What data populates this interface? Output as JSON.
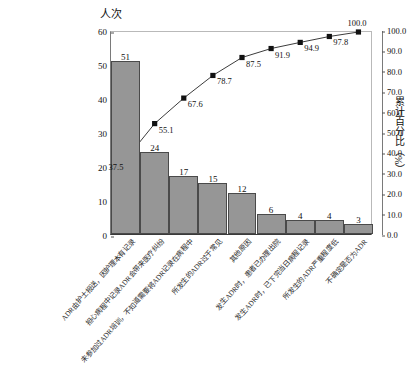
{
  "chart_data": {
    "type": "bar",
    "title": "",
    "subtitle": "",
    "ylabel": "人次",
    "ylabel_secondary": "累计百分比（%）",
    "xlabel": "",
    "grid": false,
    "legend": "none",
    "ylim": [
      0,
      60
    ],
    "ylim_secondary": [
      0,
      100
    ],
    "yticks": [
      "60",
      "50",
      "40",
      "30",
      "20",
      "10",
      "0"
    ],
    "yticks_secondary": [
      "100.0",
      "90.0",
      "80.0",
      "70.0",
      "60.0",
      "50.0",
      "40.0",
      "30.0",
      "20.0",
      "10.0",
      "0.0"
    ],
    "categories": [
      "ADR由护士报送，因护理本有记录",
      "担心病程中记录ADR会带来医疗纠纷",
      "未参加过ADR培训，不知道需要将ADR记录在病程中",
      "所发生的ADR过于常见",
      "其他原因",
      "发生ADR时，患者已办理出院",
      "发生ADR时，已下完当日病程记录",
      "所发生的ADR严重程度低",
      "不确定是否为ADR"
    ],
    "values": [
      51,
      24,
      17,
      15,
      12,
      6,
      4,
      4,
      3
    ],
    "series": [
      {
        "name": "频数",
        "type": "bar",
        "values": [
          51,
          24,
          17,
          15,
          12,
          6,
          4,
          4,
          3
        ]
      },
      {
        "name": "累计百分比",
        "type": "line",
        "axis": "secondary",
        "values": [
          37.5,
          55.1,
          67.6,
          78.7,
          87.5,
          91.9,
          94.9,
          97.8,
          100.0
        ]
      }
    ],
    "bar_labels": [
      "51",
      "24",
      "17",
      "15",
      "12",
      "6",
      "4",
      "4",
      "3"
    ],
    "point_labels": [
      "37.5",
      "55.1",
      "67.6",
      "78.7",
      "87.5",
      "91.9",
      "94.9",
      "97.8",
      "100.0"
    ],
    "colors": {
      "bar_fill": "#969696",
      "bar_stroke": "#4a4a4a",
      "line": "#3c3c3c",
      "marker": "#111111",
      "axis": "#555555",
      "background": "#ffffff"
    }
  }
}
